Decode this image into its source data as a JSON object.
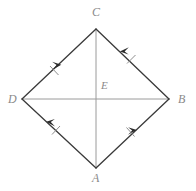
{
  "figure": {
    "kind": "geometry-diagram",
    "canvas": {
      "width": 196,
      "height": 191,
      "background": "#ffffff"
    },
    "colors": {
      "edge": "#3a3a3a",
      "diagonal": "#9a9a9a",
      "label": "#8a8a8a",
      "tick": "#7a7a7a"
    },
    "vertices": [
      {
        "id": "C",
        "label": "C",
        "x": 96,
        "y": 29,
        "label_x": 92,
        "label_y": 6
      },
      {
        "id": "B",
        "label": "B",
        "x": 169,
        "y": 99,
        "label_x": 178,
        "label_y": 93
      },
      {
        "id": "A",
        "label": "A",
        "x": 96,
        "y": 168,
        "label_x": 92,
        "label_y": 172
      },
      {
        "id": "D",
        "label": "D",
        "x": 22,
        "y": 99,
        "label_x": 8,
        "label_y": 93
      },
      {
        "id": "E",
        "label": "E",
        "x": 96,
        "y": 99,
        "label_x": 101,
        "label_y": 79
      }
    ],
    "edges": [
      {
        "id": "DC",
        "from": "D",
        "to": "C",
        "style": "arrow",
        "ticks": 1,
        "arrow_at": 0.52
      },
      {
        "id": "BC",
        "from": "B",
        "to": "C",
        "style": "arrow",
        "ticks": 1,
        "arrow_at": 0.7
      },
      {
        "id": "AD",
        "from": "A",
        "to": "D",
        "style": "arrow",
        "ticks": 1,
        "arrow_at": 0.66
      },
      {
        "id": "AB",
        "from": "A",
        "to": "B",
        "style": "arrow",
        "ticks": 1,
        "arrow_at": 0.55
      }
    ],
    "diagonals": [
      {
        "id": "CA",
        "from": "C",
        "to": "A",
        "style": "plain"
      },
      {
        "id": "DB",
        "from": "D",
        "to": "B",
        "style": "plain"
      }
    ]
  }
}
